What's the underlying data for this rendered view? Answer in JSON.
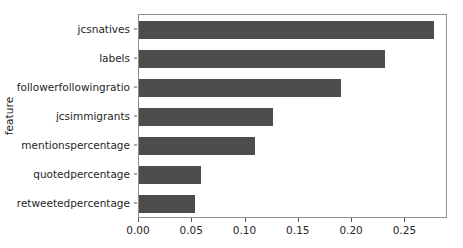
{
  "chart_data": {
    "type": "bar",
    "orientation": "horizontal",
    "title": "",
    "xlabel": "",
    "ylabel": "feature",
    "categories": [
      "jcsnatives",
      "labels",
      "followerfollowingratio",
      "jcsimmigrants",
      "mentionspercentage",
      "quotedpercentage",
      "retweetedpercentage"
    ],
    "values": [
      0.277,
      0.231,
      0.19,
      0.126,
      0.109,
      0.058,
      0.053
    ],
    "xlim": [
      0.0,
      0.29
    ],
    "xticks": [
      0.0,
      0.05,
      0.1,
      0.15,
      0.2,
      0.25
    ],
    "xtick_labels": [
      "0.00",
      "0.05",
      "0.10",
      "0.15",
      "0.20",
      "0.25"
    ],
    "grid": false,
    "legend": null,
    "bar_color": "#4d4d4d",
    "axes_color": "#8c8c8c",
    "text_color": "#262626"
  }
}
